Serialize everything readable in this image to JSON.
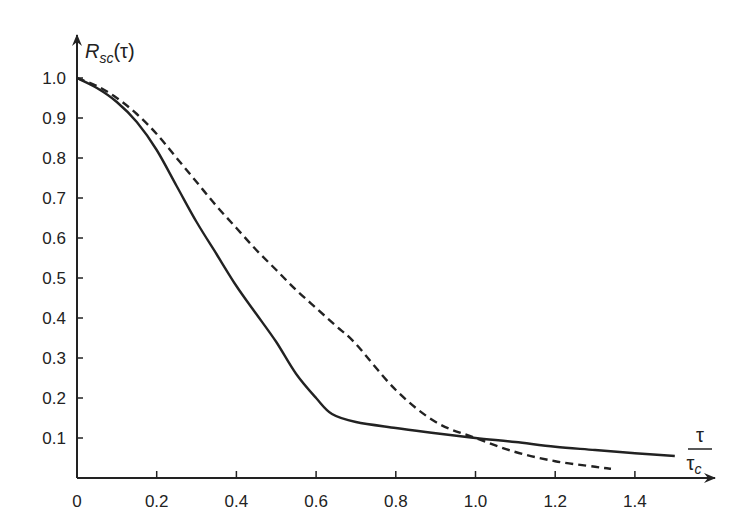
{
  "chart_data": {
    "type": "line",
    "title": "",
    "xlabel": "τ/τc",
    "ylabel": "R_sc(τ)",
    "ylabel_parts": {
      "main": "R",
      "sub": "sc",
      "arg": "(τ)"
    },
    "xlabel_parts": {
      "num": "τ",
      "den_main": "τ",
      "den_sub": "c"
    },
    "xlim": [
      0,
      1.6
    ],
    "ylim": [
      0,
      1.0
    ],
    "grid": false,
    "legend": "none",
    "x_ticks": [
      0,
      0.2,
      0.4,
      0.6,
      0.8,
      1.0,
      1.2,
      1.4
    ],
    "x_tick_labels": [
      "0",
      "0.2",
      "0.4",
      "0.6",
      "0.8",
      "1.0",
      "1.2",
      "1.4"
    ],
    "y_ticks": [
      0.1,
      0.2,
      0.3,
      0.4,
      0.5,
      0.6,
      0.7,
      0.8,
      0.9,
      1.0
    ],
    "y_tick_labels": [
      "0.1",
      "0.2",
      "0.3",
      "0.4",
      "0.5",
      "0.6",
      "0.7",
      "0.8",
      "0.9",
      "1.0"
    ],
    "series": [
      {
        "name": "solid",
        "style": "solid",
        "x": [
          0,
          0.05,
          0.1,
          0.15,
          0.2,
          0.25,
          0.3,
          0.35,
          0.4,
          0.45,
          0.5,
          0.55,
          0.6,
          0.64,
          0.7,
          0.8,
          0.9,
          1.0,
          1.1,
          1.2,
          1.3,
          1.4,
          1.5
        ],
        "values": [
          1.0,
          0.975,
          0.94,
          0.89,
          0.82,
          0.73,
          0.64,
          0.56,
          0.48,
          0.41,
          0.34,
          0.26,
          0.2,
          0.16,
          0.14,
          0.125,
          0.112,
          0.1,
          0.09,
          0.078,
          0.07,
          0.062,
          0.055
        ]
      },
      {
        "name": "dashed",
        "style": "dashed",
        "x": [
          0,
          0.05,
          0.1,
          0.15,
          0.2,
          0.25,
          0.3,
          0.35,
          0.4,
          0.45,
          0.5,
          0.55,
          0.6,
          0.65,
          0.7,
          0.8,
          0.9,
          1.0,
          1.1,
          1.2,
          1.3,
          1.34
        ],
        "values": [
          1.0,
          0.98,
          0.95,
          0.91,
          0.86,
          0.8,
          0.74,
          0.68,
          0.625,
          0.57,
          0.52,
          0.47,
          0.425,
          0.38,
          0.335,
          0.22,
          0.14,
          0.1,
          0.065,
          0.042,
          0.028,
          0.023
        ]
      }
    ]
  }
}
